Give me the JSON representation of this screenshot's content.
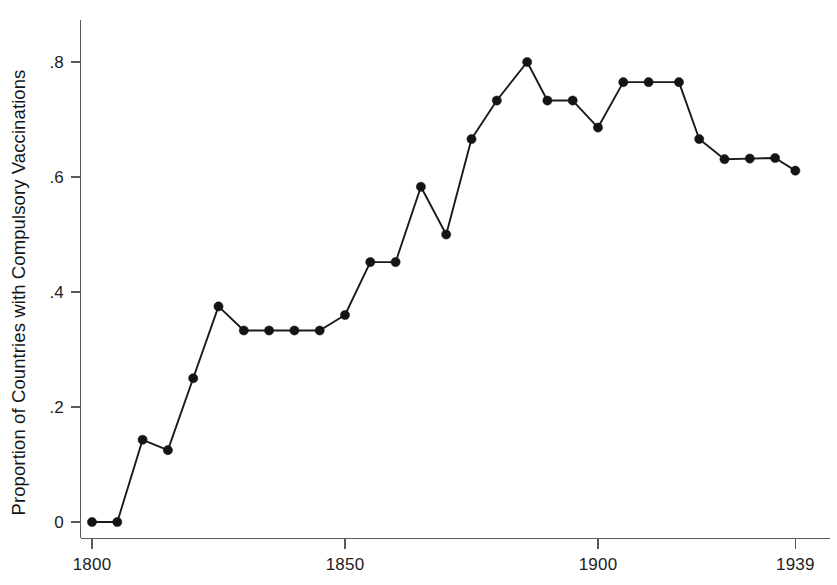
{
  "chart_data": {
    "type": "line",
    "title": "",
    "subtitle": "",
    "xlabel": "",
    "ylabel": "Proportion of Countries with Compulsory Vaccinations",
    "xlim": [
      1800,
      1939
    ],
    "ylim": [
      0,
      0.87
    ],
    "grid": false,
    "legend": null,
    "x_tick_labels": [
      "1800",
      "1850",
      "1900",
      "1939"
    ],
    "x_tick_values": [
      1800,
      1850,
      1900,
      1939
    ],
    "y_tick_labels": [
      "0",
      ".2",
      ".4",
      ".6",
      ".8"
    ],
    "y_tick_values": [
      0,
      0.2,
      0.4,
      0.6,
      0.8
    ],
    "marker": "filled-circle",
    "line_color": "#141414",
    "marker_color": "#141414",
    "axis_color": "#5a5a5a",
    "background_color": "#ffffff",
    "x": [
      1800,
      1805,
      1810,
      1815,
      1820,
      1825,
      1830,
      1835,
      1840,
      1845,
      1850,
      1855,
      1860,
      1865,
      1870,
      1875,
      1880,
      1886,
      1890,
      1895,
      1900,
      1905,
      1910,
      1916,
      1920,
      1925,
      1930,
      1935,
      1939
    ],
    "values": [
      0,
      0,
      0.143,
      0.125,
      0.25,
      0.375,
      0.333,
      0.333,
      0.333,
      0.333,
      0.36,
      0.452,
      0.452,
      0.583,
      0.5,
      0.666,
      0.733,
      0.8,
      0.733,
      0.733,
      0.686,
      0.765,
      0.765,
      0.765,
      0.666,
      0.631,
      0.632,
      0.633,
      0.611
    ],
    "series": [
      {
        "name": "Proportion of Countries with Compulsory Vaccinations",
        "values": [
          0,
          0,
          0.143,
          0.125,
          0.25,
          0.375,
          0.333,
          0.333,
          0.333,
          0.333,
          0.36,
          0.452,
          0.452,
          0.583,
          0.5,
          0.666,
          0.733,
          0.8,
          0.733,
          0.733,
          0.686,
          0.765,
          0.765,
          0.765,
          0.666,
          0.631,
          0.632,
          0.633,
          0.611
        ]
      }
    ]
  }
}
